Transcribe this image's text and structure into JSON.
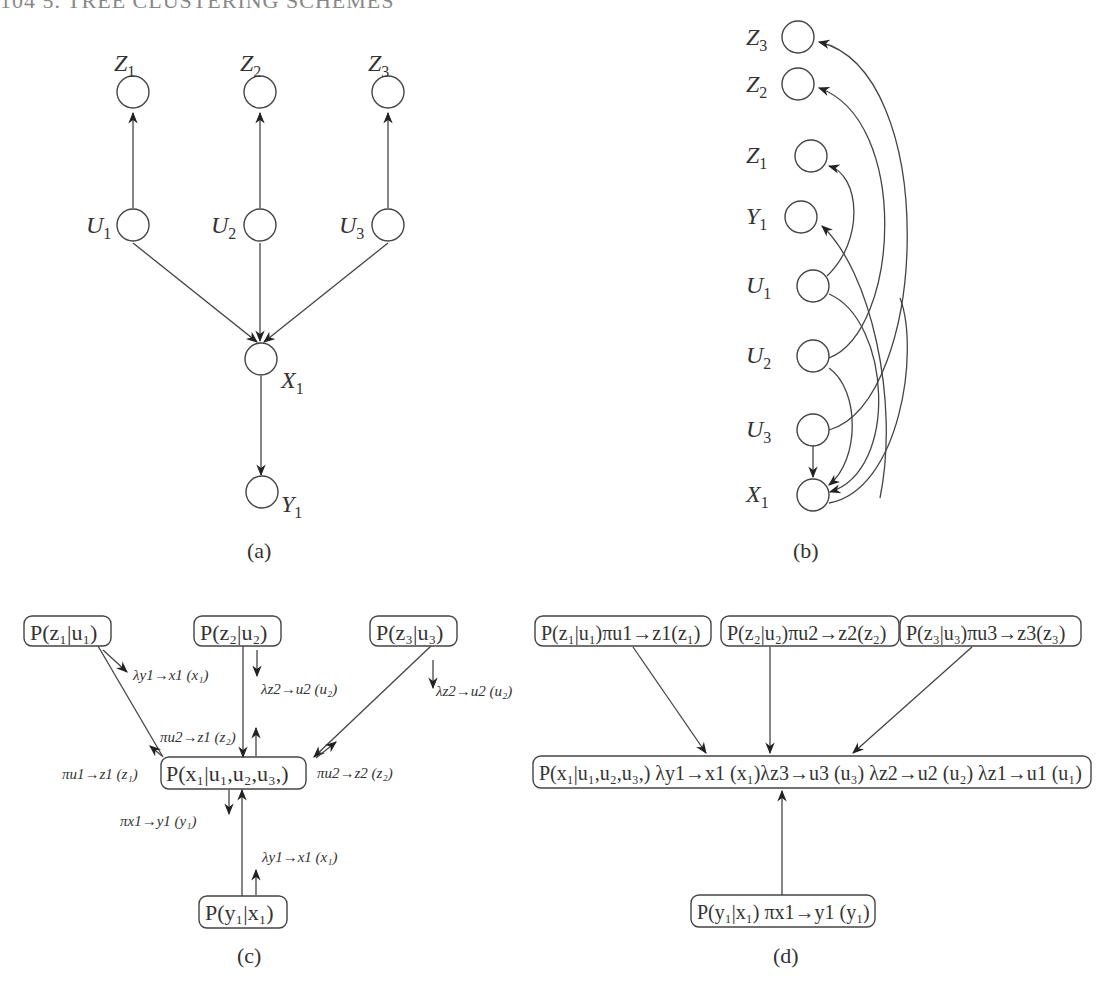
{
  "header": {
    "text": "104   5. TREE CLUSTERING SCHEMES"
  },
  "panel_a": {
    "caption": "(a)",
    "nodes": {
      "Z1": "Z",
      "Z2": "Z",
      "Z3": "Z",
      "U1": "U",
      "U2": "U",
      "U3": "U",
      "X1": "X",
      "Y1": "Y"
    },
    "subs": {
      "Z1": "1",
      "Z2": "2",
      "Z3": "3",
      "U1": "1",
      "U2": "2",
      "U3": "3",
      "X1": "1",
      "Y1": "1"
    },
    "edges": [
      "U1->Z1",
      "U2->Z2",
      "U3->Z3",
      "U1->X1",
      "U2->X1",
      "U3->X1",
      "X1->Y1"
    ]
  },
  "panel_b": {
    "caption": "(b)",
    "order": [
      "Z3",
      "Z2",
      "Z1",
      "Y1",
      "U1",
      "U2",
      "U3",
      "X1"
    ],
    "edges": [
      "U1->Z1",
      "X1->Y1",
      "U2->Z2",
      "U3->Z3",
      "U3->X1",
      "U2->X1",
      "U1->X1"
    ]
  },
  "panel_c": {
    "caption": "(c)",
    "boxes": {
      "pz1": "P(z₁|u₁)",
      "pz2": "P(z₂|u₂)",
      "pz3": "P(z₃|u₃)",
      "px1": "P(x₁|u₁,u₂,u₃,)",
      "py1": "P(y₁|x₁)"
    },
    "messages": {
      "m1": "λy1→x1 (x₁)",
      "m2": "λz2→u2 (u₂)",
      "m3": "λz2→u2 (u₂)",
      "m4": "πu2→z1 (z₂)",
      "m5": "πu1→z1 (z₁)",
      "m6": "πu2→z2 (z₂)",
      "m7": "πx1→y1 (y₁)",
      "m8": "λy1→x1 (x₁)"
    }
  },
  "panel_d": {
    "caption": "(d)",
    "boxes": {
      "b1": "P(z₁|u₁)πu1→z1(z₁)",
      "b2": "P(z₂|u₂)πu2→z2(z₂)",
      "b3": "P(z₃|u₃)πu3→z3(z₃)",
      "b4": "P(x₁|u₁,u₂,u₃,) λy1→x1 (x₁)λz3→u3 (u₃) λz2→u2 (u₂) λz1→u1 (u₁)",
      "b5": "P(y₁|x₁) πx1→y1 (y₁)"
    }
  }
}
